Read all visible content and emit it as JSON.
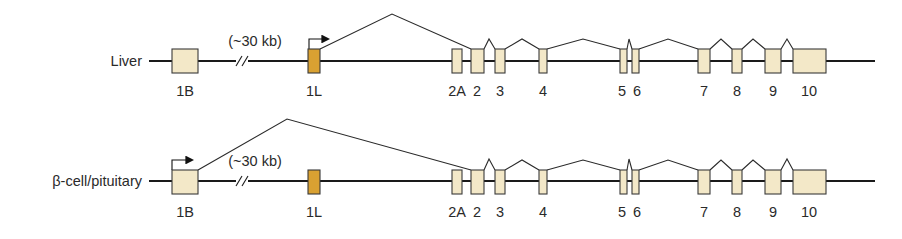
{
  "diagram": {
    "colors": {
      "exon_fill": "#f3e8c8",
      "alt_exon_fill": "#d9a132",
      "line": "#1a1a1a"
    },
    "gap_label": "(~30 kb)",
    "tracks": [
      {
        "label": "Liver",
        "active_promoter": "1L",
        "exons": [
          "1B",
          "1L",
          "2A",
          "2",
          "3",
          "4",
          "5",
          "6",
          "7",
          "8",
          "9",
          "10"
        ]
      },
      {
        "label": "β-cell/pituitary",
        "active_promoter": "1B",
        "exons": [
          "1B",
          "1L",
          "2A",
          "2",
          "3",
          "4",
          "5",
          "6",
          "7",
          "8",
          "9",
          "10"
        ]
      }
    ],
    "exon_labels": [
      "1B",
      "1L",
      "2A",
      "2",
      "3",
      "4",
      "5",
      "6",
      "7",
      "8",
      "9",
      "10"
    ]
  }
}
